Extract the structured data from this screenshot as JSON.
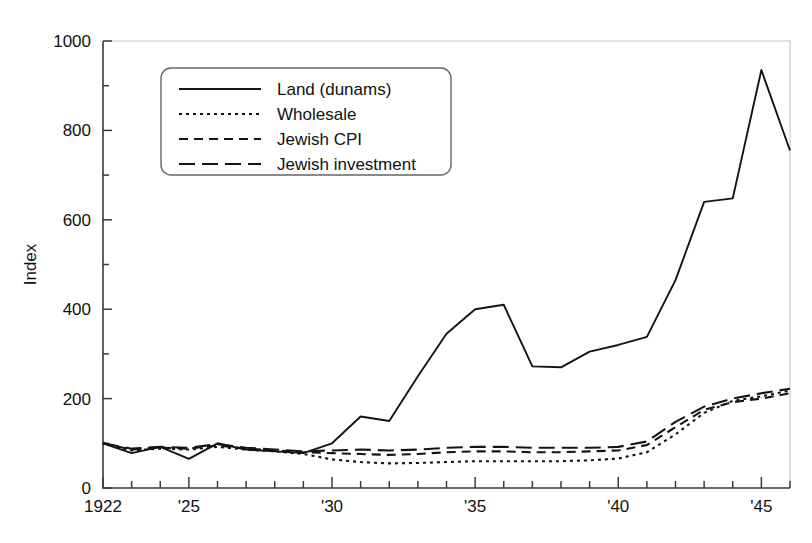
{
  "chart_data": {
    "type": "line",
    "title": "",
    "xlabel": "",
    "ylabel": "Index",
    "xlim": [
      1922,
      1946
    ],
    "ylim": [
      0,
      1000
    ],
    "ytick_values": [
      0,
      200,
      400,
      600,
      800,
      1000
    ],
    "ytick_labels": [
      "0",
      "200",
      "400",
      "600",
      "800",
      "1000"
    ],
    "yminor_values": [
      100,
      300,
      500,
      700,
      900
    ],
    "xtick_values": [
      1922,
      1923,
      1924,
      1925,
      1926,
      1927,
      1928,
      1929,
      1930,
      1931,
      1932,
      1933,
      1934,
      1935,
      1936,
      1937,
      1938,
      1939,
      1940,
      1941,
      1942,
      1943,
      1944,
      1945,
      1946
    ],
    "xtick_labeled": [
      {
        "value": 1922,
        "label": "1922"
      },
      {
        "value": 1925,
        "label": "'25"
      },
      {
        "value": 1930,
        "label": "'30"
      },
      {
        "value": 1935,
        "label": "'35"
      },
      {
        "value": 1940,
        "label": "'40"
      },
      {
        "value": 1945,
        "label": "'45"
      }
    ],
    "grid": false,
    "legend_position": "upper-left-inside",
    "x": [
      1922,
      1923,
      1924,
      1925,
      1926,
      1927,
      1928,
      1929,
      1930,
      1931,
      1932,
      1933,
      1934,
      1935,
      1936,
      1937,
      1938,
      1939,
      1940,
      1941,
      1942,
      1943,
      1944,
      1945,
      1946
    ],
    "series": [
      {
        "name": "Land (dunams)",
        "style": "solid",
        "color": "#141414",
        "values": [
          100,
          78,
          92,
          65,
          100,
          86,
          82,
          78,
          100,
          160,
          150,
          250,
          345,
          400,
          410,
          272,
          270,
          305,
          320,
          338,
          465,
          640,
          648,
          935,
          755
        ]
      },
      {
        "name": "Wholesale",
        "style": "dotted",
        "color": "#141414",
        "values": [
          100,
          84,
          88,
          86,
          92,
          86,
          82,
          76,
          64,
          58,
          55,
          56,
          58,
          60,
          60,
          60,
          60,
          62,
          66,
          80,
          120,
          168,
          195,
          205,
          218
        ]
      },
      {
        "name": "Jewish CPI",
        "style": "dashed",
        "color": "#141414",
        "values": [
          100,
          86,
          90,
          88,
          95,
          88,
          84,
          80,
          78,
          76,
          74,
          76,
          80,
          82,
          82,
          80,
          80,
          82,
          84,
          96,
          136,
          175,
          192,
          200,
          212
        ]
      },
      {
        "name": "Jewish investment",
        "style": "longdash",
        "color": "#141414",
        "values": [
          100,
          88,
          92,
          90,
          98,
          90,
          86,
          82,
          84,
          86,
          84,
          86,
          90,
          92,
          92,
          90,
          90,
          90,
          92,
          104,
          148,
          182,
          200,
          212,
          222
        ]
      }
    ]
  },
  "legend": {
    "items": [
      {
        "label": "Land (dunams)",
        "style": "solid"
      },
      {
        "label": "Wholesale",
        "style": "dotted"
      },
      {
        "label": "Jewish CPI",
        "style": "dashed"
      },
      {
        "label": "Jewish investment",
        "style": "longdash"
      }
    ]
  }
}
